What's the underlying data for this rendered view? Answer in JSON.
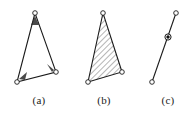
{
  "figure": {
    "panel_count": 3,
    "background_color": "#ffffff",
    "line_color": "#1a1a1a",
    "hatch_color": "#3a3a3a",
    "joint_fill_open": "#ffffff",
    "joint_fill_solid": "#111111",
    "captions": [
      {
        "label": "(a)",
        "name": "caption-a"
      },
      {
        "label": "(b)",
        "name": "caption-b"
      },
      {
        "label": "(c)",
        "name": "caption-c"
      }
    ],
    "panels": [
      {
        "id": "a",
        "description": "pin-jointed triangular frame, outline only",
        "shape": "triangle",
        "filled": false,
        "vertices": [
          {
            "name": "apex",
            "x": 35,
            "y": 13,
            "joint": "open-circle"
          },
          {
            "name": "lower-left",
            "x": 17,
            "y": 82,
            "joint": "open-circle"
          },
          {
            "name": "lower-right",
            "x": 56,
            "y": 72,
            "joint": "open-circle"
          }
        ]
      },
      {
        "id": "b",
        "description": "rigid triangular body with 45-degree hatching",
        "shape": "triangle",
        "filled": true,
        "fill_pattern": "diagonal-hatch",
        "vertices": [
          {
            "name": "apex",
            "x": 103,
            "y": 13,
            "joint": "open-circle"
          },
          {
            "name": "lower-left",
            "x": 88,
            "y": 82,
            "joint": "open-circle"
          },
          {
            "name": "lower-right",
            "x": 122,
            "y": 72,
            "joint": "open-circle"
          }
        ]
      },
      {
        "id": "c",
        "description": "two-force member rod with end pins and solid middle joint",
        "shape": "line",
        "endpoints": [
          {
            "name": "upper-end",
            "x": 176,
            "y": 13,
            "joint": "open-circle"
          },
          {
            "name": "lower-end",
            "x": 152,
            "y": 82,
            "joint": "open-circle"
          }
        ],
        "middle_joint": {
          "name": "mid-pin",
          "x": 164,
          "y": 40,
          "joint": "solid-circle"
        }
      }
    ]
  }
}
